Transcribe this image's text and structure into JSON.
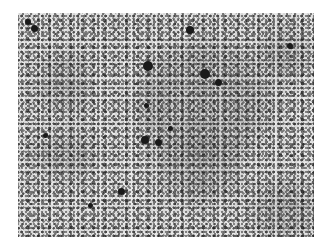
{
  "image": {
    "type": "grayscale micrograph",
    "description": "Speckled grayscale texture of dark particles on a light background with diffuse darker cloudy regions",
    "colors": {
      "background": "#d9d9d9",
      "particles": "#1a1a1a",
      "cloud": "#8a8a8a",
      "page": "#ffffff"
    },
    "clouds": [
      {
        "x": 120,
        "y": 30,
        "w": 130,
        "h": 120
      },
      {
        "x": 20,
        "y": 40,
        "w": 50,
        "h": 60
      },
      {
        "x": 15,
        "y": 120,
        "w": 60,
        "h": 45
      },
      {
        "x": 235,
        "y": 170,
        "w": 70,
        "h": 55
      },
      {
        "x": 140,
        "y": 120,
        "w": 80,
        "h": 70
      },
      {
        "x": 240,
        "y": 20,
        "w": 55,
        "h": 45
      }
    ],
    "blobs": [
      {
        "x": 148,
        "y": 66,
        "r": 5
      },
      {
        "x": 205,
        "y": 74,
        "r": 5
      },
      {
        "x": 218,
        "y": 82,
        "r": 3.5
      },
      {
        "x": 190,
        "y": 30,
        "r": 4
      },
      {
        "x": 34,
        "y": 28,
        "r": 3.5
      },
      {
        "x": 28,
        "y": 22,
        "r": 3
      },
      {
        "x": 145,
        "y": 140,
        "r": 4
      },
      {
        "x": 158,
        "y": 142,
        "r": 3.5
      },
      {
        "x": 121,
        "y": 191,
        "r": 3.5
      },
      {
        "x": 290,
        "y": 46,
        "r": 3
      },
      {
        "x": 146,
        "y": 105,
        "r": 2.5
      },
      {
        "x": 45,
        "y": 135,
        "r": 2.5
      },
      {
        "x": 170,
        "y": 128,
        "r": 2.5
      },
      {
        "x": 90,
        "y": 205,
        "r": 2.5
      }
    ]
  }
}
